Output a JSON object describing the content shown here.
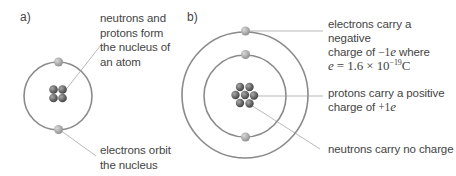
{
  "panels": {
    "a": {
      "label": "a)",
      "annotations": {
        "nucleus": [
          "neutrons and",
          "protons form",
          "the nucleus of",
          "an atom"
        ],
        "electrons": [
          "electrons orbit",
          "the nucleus"
        ]
      }
    },
    "b": {
      "label": "b)",
      "annotations": {
        "electrons_line1": "electrons carry a negative",
        "electrons_line2_pre": "charge of ",
        "electrons_line2_math": "−1",
        "electrons_line2_e": "e",
        "electrons_line2_post": " where",
        "electrons_line3_e": "e",
        "electrons_line3_eq": " = 1.6 × 10",
        "electrons_line3_exp": "−19",
        "electrons_line3_unit": "C",
        "protons_line1": "protons carry a positive",
        "protons_line2_pre": "charge of ",
        "protons_line2_math": "+1",
        "protons_line2_e": "e",
        "neutrons": "neutrons carry no charge"
      }
    }
  },
  "colors": {
    "orbit": "#8a8a8a",
    "electron": "#a9a9a9",
    "nucleon": "#6e6e6e",
    "leader": "#9a9a9a",
    "text": "#444444"
  }
}
